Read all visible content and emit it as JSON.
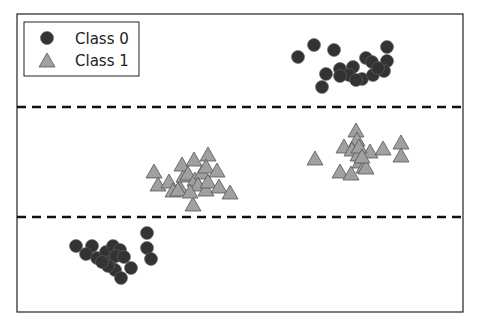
{
  "chart_data": {
    "type": "scatter",
    "title": "",
    "xlabel": "",
    "ylabel": "",
    "grid": false,
    "axes_ticks": false,
    "legend_position": "upper left",
    "legend": [
      {
        "label": "Class 0",
        "marker": "circle",
        "color": "#333333"
      },
      {
        "label": "Class 1",
        "marker": "triangle",
        "color": "#a0a0a0"
      }
    ],
    "decision_boundaries": [
      {
        "style": "dashed",
        "orientation": "horizontal",
        "y_px": 107
      },
      {
        "style": "dashed",
        "orientation": "horizontal",
        "y_px": 217
      }
    ],
    "frame_px": {
      "left": 17,
      "top": 14,
      "right": 463,
      "bottom": 312
    },
    "series": [
      {
        "name": "Class 0",
        "marker": "circle",
        "points_px": [
          [
            298,
            57
          ],
          [
            314,
            45
          ],
          [
            334,
            50
          ],
          [
            326,
            74
          ],
          [
            322,
            87
          ],
          [
            340,
            69
          ],
          [
            387,
            47
          ],
          [
            387,
            61
          ],
          [
            366,
            58
          ],
          [
            372,
            62
          ],
          [
            353,
            67
          ],
          [
            349,
            75
          ],
          [
            362,
            79
          ],
          [
            373,
            75
          ],
          [
            384,
            71
          ],
          [
            340,
            76
          ],
          [
            356,
            80
          ],
          [
            378,
            68
          ],
          [
            76,
            246
          ],
          [
            92,
            246
          ],
          [
            86,
            254
          ],
          [
            97,
            258
          ],
          [
            106,
            252
          ],
          [
            113,
            246
          ],
          [
            120,
            250
          ],
          [
            110,
            262
          ],
          [
            116,
            256
          ],
          [
            124,
            257
          ],
          [
            131,
            268
          ],
          [
            115,
            270
          ],
          [
            121,
            278
          ],
          [
            108,
            266
          ],
          [
            102,
            262
          ],
          [
            147,
            233
          ],
          [
            147,
            248
          ],
          [
            151,
            259
          ]
        ]
      },
      {
        "name": "Class 1",
        "marker": "triangle",
        "points_px": [
          [
            154,
            172
          ],
          [
            158,
            185
          ],
          [
            169,
            182
          ],
          [
            173,
            191
          ],
          [
            180,
            188
          ],
          [
            184,
            176
          ],
          [
            182,
            165
          ],
          [
            194,
            160
          ],
          [
            188,
            174
          ],
          [
            195,
            180
          ],
          [
            202,
            173
          ],
          [
            198,
            185
          ],
          [
            206,
            190
          ],
          [
            208,
            155
          ],
          [
            206,
            167
          ],
          [
            208,
            182
          ],
          [
            217,
            171
          ],
          [
            219,
            187
          ],
          [
            230,
            193
          ],
          [
            193,
            205
          ],
          [
            178,
            190
          ],
          [
            190,
            192
          ],
          [
            315,
            159
          ],
          [
            344,
            147
          ],
          [
            356,
            131
          ],
          [
            357,
            140
          ],
          [
            352,
            150
          ],
          [
            358,
            155
          ],
          [
            360,
            162
          ],
          [
            364,
            167
          ],
          [
            370,
            152
          ],
          [
            383,
            149
          ],
          [
            401,
            143
          ],
          [
            401,
            156
          ],
          [
            340,
            172
          ],
          [
            351,
            174
          ],
          [
            366,
            168
          ],
          [
            359,
            147
          ],
          [
            362,
            157
          ]
        ]
      }
    ]
  },
  "legend": {
    "items": [
      {
        "label": "Class 0"
      },
      {
        "label": "Class 1"
      }
    ]
  }
}
